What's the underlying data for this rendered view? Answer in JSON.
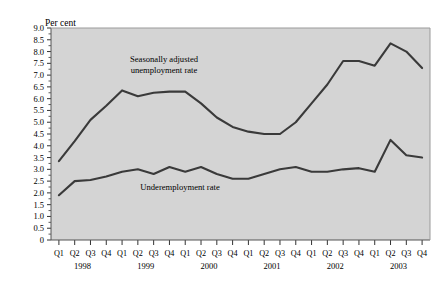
{
  "chart_data": {
    "type": "line",
    "title": "",
    "subtitle": "",
    "ylabel": "Per cent",
    "xlabel": "",
    "ylim": [
      0,
      9.0
    ],
    "ytick_step": 0.5,
    "grid": false,
    "legend_position": "inline-annotations",
    "plot_background": "#d4d4d4",
    "line_color": "#3a3a3a",
    "yticks": [
      "0",
      "0.5",
      "1.0",
      "1.5",
      "2.0",
      "2.5",
      "3.0",
      "3.5",
      "4.0",
      "4.5",
      "5.0",
      "5.5",
      "6.0",
      "6.5",
      "7.0",
      "7.5",
      "8.0",
      "8.5",
      "9.0"
    ],
    "ytick_values": [
      0,
      0.5,
      1.0,
      1.5,
      2.0,
      2.5,
      3.0,
      3.5,
      4.0,
      4.5,
      5.0,
      5.5,
      6.0,
      6.5,
      7.0,
      7.5,
      8.0,
      8.5,
      9.0
    ],
    "categories": [
      "Q1",
      "Q2",
      "Q3",
      "Q4",
      "Q1",
      "Q2",
      "Q3",
      "Q4",
      "Q1",
      "Q2",
      "Q3",
      "Q4",
      "Q1",
      "Q2",
      "Q3",
      "Q4",
      "Q1",
      "Q2",
      "Q3",
      "Q4",
      "Q1",
      "Q2",
      "Q3",
      "Q4"
    ],
    "year_groups": [
      {
        "label": "1998",
        "start_index": 0,
        "end_index": 3
      },
      {
        "label": "1999",
        "start_index": 4,
        "end_index": 7
      },
      {
        "label": "2000",
        "start_index": 8,
        "end_index": 11
      },
      {
        "label": "2001",
        "start_index": 12,
        "end_index": 15
      },
      {
        "label": "2002",
        "start_index": 16,
        "end_index": 19
      },
      {
        "label": "2003",
        "start_index": 20,
        "end_index": 23
      }
    ],
    "series": [
      {
        "name": "Seasonally adjusted unemployment rate",
        "annotation_lines": [
          "Seasonally adjusted",
          "unemployment rate"
        ],
        "values": [
          3.35,
          4.2,
          5.1,
          5.7,
          6.35,
          6.1,
          6.25,
          6.3,
          6.3,
          5.8,
          5.2,
          4.8,
          4.6,
          4.5,
          4.5,
          5.0,
          5.8,
          6.6,
          7.6,
          7.6,
          7.4,
          8.35,
          8.0,
          7.3
        ]
      },
      {
        "name": "Underemployment rate",
        "annotation_lines": [
          "Underemployment rate"
        ],
        "values": [
          1.9,
          2.5,
          2.55,
          2.7,
          2.9,
          3.0,
          2.8,
          3.1,
          2.9,
          3.1,
          2.8,
          2.6,
          2.6,
          2.8,
          3.0,
          3.1,
          2.9,
          2.9,
          3.0,
          3.05,
          2.9,
          4.25,
          3.6,
          3.5
        ]
      }
    ]
  }
}
